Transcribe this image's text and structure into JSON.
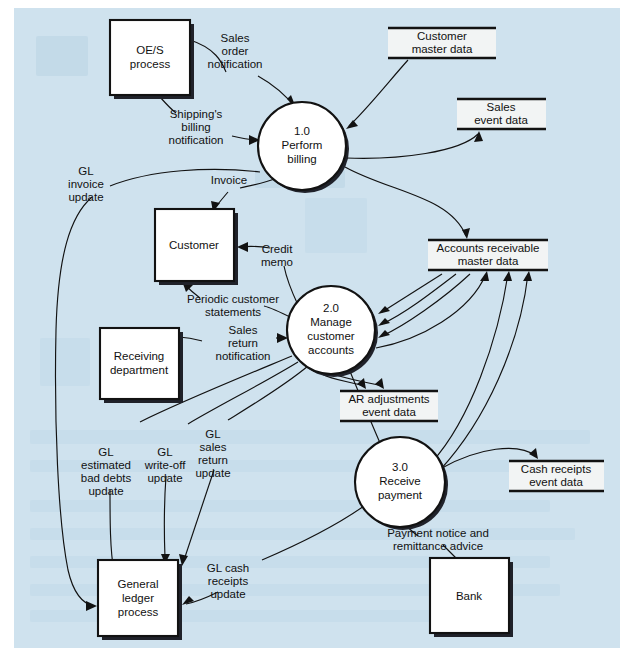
{
  "diagram": {
    "background_color": "#cfe2ee",
    "line_color": "#121212",
    "node_fill": "#ffffff",
    "store_fill": "#f2f4f4"
  },
  "processes": [
    {
      "id": "p1",
      "number": "1.0",
      "line1": "Perform",
      "line2": "billing",
      "line3": "",
      "cx": 302,
      "cy": 146,
      "r": 44
    },
    {
      "id": "p2",
      "number": "2.0",
      "line1": "Manage",
      "line2": "customer",
      "line3": "accounts",
      "cx": 331,
      "cy": 330,
      "r": 44
    },
    {
      "id": "p3",
      "number": "3.0",
      "line1": "Receive",
      "line2": "payment",
      "line3": "",
      "cx": 400,
      "cy": 482,
      "r": 45
    }
  ],
  "entities": [
    {
      "id": "e1",
      "line1": "OE/S",
      "line2": "process",
      "line3": "",
      "x": 110,
      "y": 20,
      "w": 80,
      "h": 75
    },
    {
      "id": "e2",
      "line1": "Customer",
      "line2": "",
      "line3": "",
      "x": 155,
      "y": 209,
      "w": 79,
      "h": 72
    },
    {
      "id": "e3",
      "line1": "Receiving",
      "line2": "department",
      "line3": "",
      "x": 100,
      "y": 328,
      "w": 79,
      "h": 71
    },
    {
      "id": "e4",
      "line1": "General",
      "line2": "ledger",
      "line3": "process",
      "x": 98,
      "y": 560,
      "w": 80,
      "h": 76
    },
    {
      "id": "e5",
      "line1": "Bank",
      "line2": "",
      "line3": "",
      "x": 430,
      "y": 558,
      "w": 79,
      "h": 75
    }
  ],
  "data_stores": [
    {
      "id": "d1",
      "line1": "Customer",
      "line2": "master data",
      "x": 388,
      "y": 28,
      "w": 108,
      "h": 30
    },
    {
      "id": "d2",
      "line1": "Sales",
      "line2": "event data",
      "x": 457,
      "y": 99,
      "w": 89,
      "h": 30
    },
    {
      "id": "d3",
      "line1": "Accounts receivable",
      "line2": "master data",
      "x": 428,
      "y": 240,
      "w": 120,
      "h": 30
    },
    {
      "id": "d4",
      "line1": "AR adjustments",
      "line2": "event data",
      "x": 340,
      "y": 391,
      "w": 98,
      "h": 30
    },
    {
      "id": "d5",
      "line1": "Cash receipts",
      "line2": "event data",
      "x": 509,
      "y": 461,
      "w": 95,
      "h": 30
    }
  ],
  "flow_labels": [
    {
      "id": "f1",
      "lines": [
        "Sales",
        "order",
        "notification"
      ],
      "x": 235,
      "y": 42,
      "anchor": "middle"
    },
    {
      "id": "f2",
      "lines": [
        "Shipping's",
        "billing",
        "notification"
      ],
      "x": 196,
      "y": 118,
      "anchor": "middle"
    },
    {
      "id": "f3",
      "lines": [
        "GL",
        "invoice",
        "update"
      ],
      "x": 86,
      "y": 175,
      "anchor": "middle"
    },
    {
      "id": "f4",
      "lines": [
        "Invoice"
      ],
      "x": 229,
      "y": 184,
      "anchor": "middle"
    },
    {
      "id": "f5",
      "lines": [
        "Credit",
        "memo"
      ],
      "x": 277,
      "y": 253,
      "anchor": "middle"
    },
    {
      "id": "f6",
      "lines": [
        "Periodic customer",
        "statements"
      ],
      "x": 233,
      "y": 303,
      "anchor": "middle"
    },
    {
      "id": "f7",
      "lines": [
        "Sales",
        "return",
        "notification"
      ],
      "x": 243,
      "y": 334,
      "anchor": "middle"
    },
    {
      "id": "f8",
      "lines": [
        "GL",
        "estimated",
        "bad debts",
        "update"
      ],
      "x": 106,
      "y": 456,
      "anchor": "middle"
    },
    {
      "id": "f9",
      "lines": [
        "GL",
        "write-off",
        "update"
      ],
      "x": 165,
      "y": 456,
      "anchor": "middle"
    },
    {
      "id": "f10",
      "lines": [
        "GL",
        "sales",
        "return",
        "update"
      ],
      "x": 213,
      "y": 438,
      "anchor": "middle"
    },
    {
      "id": "f11",
      "lines": [
        "Payment notice and",
        "remittance advice"
      ],
      "x": 438,
      "y": 537,
      "anchor": "middle"
    },
    {
      "id": "f12",
      "lines": [
        "GL cash",
        "receipts",
        "update"
      ],
      "x": 228,
      "y": 572,
      "anchor": "middle"
    }
  ],
  "flows": [
    {
      "from": "OE/S process",
      "to": "1.0 Perform billing",
      "label": "Sales order notification"
    },
    {
      "from": "OE/S process",
      "to": "1.0 Perform billing",
      "label": "Shipping's billing notification"
    },
    {
      "from": "Customer master data",
      "to": "1.0 Perform billing",
      "label": ""
    },
    {
      "from": "1.0 Perform billing",
      "to": "Sales event data",
      "label": ""
    },
    {
      "from": "1.0 Perform billing",
      "to": "Accounts receivable master data",
      "label": ""
    },
    {
      "from": "1.0 Perform billing",
      "to": "Customer",
      "label": "Invoice"
    },
    {
      "from": "1.0 Perform billing",
      "to": "General ledger process",
      "label": "GL invoice update"
    },
    {
      "from": "2.0 Manage customer accounts",
      "to": "Customer",
      "label": "Credit memo"
    },
    {
      "from": "2.0 Manage customer accounts",
      "to": "Customer",
      "label": "Periodic customer statements"
    },
    {
      "from": "Receiving department",
      "to": "2.0 Manage customer accounts",
      "label": "Sales return notification"
    },
    {
      "from": "2.0 Manage customer accounts",
      "to": "AR adjustments event data",
      "label": ""
    },
    {
      "from": "2.0 Manage customer accounts",
      "to": "Accounts receivable master data",
      "label": ""
    },
    {
      "from": "Accounts receivable master data",
      "to": "2.0 Manage customer accounts",
      "label": ""
    },
    {
      "from": "2.0 Manage customer accounts",
      "to": "General ledger process",
      "label": "GL estimated bad debts update"
    },
    {
      "from": "2.0 Manage customer accounts",
      "to": "General ledger process",
      "label": "GL write-off update"
    },
    {
      "from": "2.0 Manage customer accounts",
      "to": "General ledger process",
      "label": "GL sales return update"
    },
    {
      "from": "Bank",
      "to": "3.0 Receive payment",
      "label": "Payment notice and remittance advice"
    },
    {
      "from": "3.0 Receive payment",
      "to": "Cash receipts event data",
      "label": ""
    },
    {
      "from": "3.0 Receive payment",
      "to": "Accounts receivable master data",
      "label": ""
    },
    {
      "from": "3.0 Receive payment",
      "to": "General ledger process",
      "label": "GL cash receipts update"
    }
  ]
}
